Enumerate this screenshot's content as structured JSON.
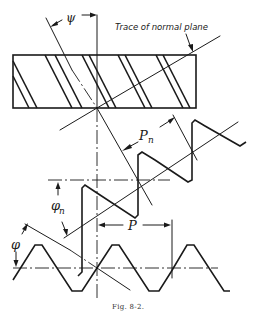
{
  "figure": {
    "caption": "Fig. 8-2.",
    "labels": {
      "helix_angle": "ψ",
      "trace_note": "Trace of normal plane",
      "normal_pitch": "P",
      "normal_pitch_sub": "n",
      "normal_pressure_angle": "φ",
      "normal_pressure_angle_sub": "n",
      "pitch": "P",
      "pressure_angle": "φ"
    },
    "views": [
      "helical rack top view with slanted teeth",
      "normal section tooth profile",
      "transverse section tooth profile"
    ]
  }
}
